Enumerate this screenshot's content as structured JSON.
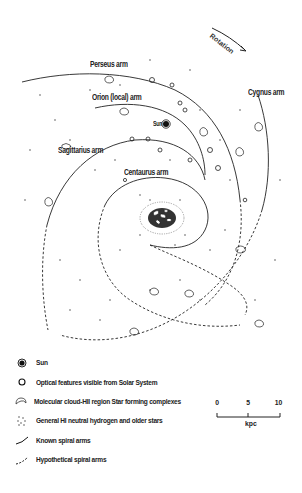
{
  "figure": {
    "rotation_label": "Rotation",
    "sun_label": "Sun",
    "arm_labels": [
      {
        "id": "perseus",
        "text": "Perseus arm"
      },
      {
        "id": "orion",
        "text": "Orion (local) arm"
      },
      {
        "id": "sagittarius",
        "text": "Sagittarius arm"
      },
      {
        "id": "centaurus",
        "text": "Centaurus arm"
      },
      {
        "id": "cygnus",
        "text": "Cygnus arm"
      }
    ]
  },
  "legend": {
    "items": [
      {
        "icon": "sun-filled-circle-icon",
        "label": "Sun"
      },
      {
        "icon": "open-circle-icon",
        "label": "Optical features visible from Solar System"
      },
      {
        "icon": "cloud-outline-icon",
        "label": "Molecular cloud-HII region Star forming complexes"
      },
      {
        "icon": "dots-icon",
        "label": "General HI neutral hydrogen and older stars"
      },
      {
        "icon": "solid-line-icon",
        "label": "Known spiral arms"
      },
      {
        "icon": "dashed-line-icon",
        "label": "Hypothetical spiral arms"
      }
    ]
  },
  "scale_bar": {
    "ticks": [
      "0",
      "5",
      "10"
    ],
    "unit": "kpc"
  },
  "colors": {
    "ink": "#1a1a1a",
    "background": "#ffffff"
  }
}
